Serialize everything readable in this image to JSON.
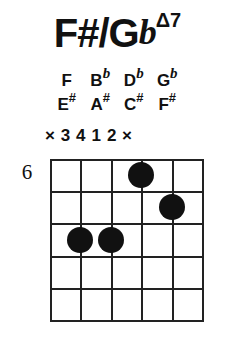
{
  "chord": {
    "root_primary": "F#",
    "slash": "/",
    "root_secondary": "G",
    "root_secondary_flat": "b",
    "quality": "Δ7",
    "full_name": "F#/GbΔ7"
  },
  "notes_flat": [
    {
      "letter": "F",
      "accidental": ""
    },
    {
      "letter": "B",
      "accidental": "b"
    },
    {
      "letter": "D",
      "accidental": "b"
    },
    {
      "letter": "G",
      "accidental": "b"
    }
  ],
  "notes_sharp": [
    {
      "letter": "E",
      "accidental": "#"
    },
    {
      "letter": "A",
      "accidental": "#"
    },
    {
      "letter": "C",
      "accidental": "#"
    },
    {
      "letter": "F",
      "accidental": "#"
    }
  ],
  "fingering": [
    "×",
    "3",
    "4",
    "1",
    "2",
    "×"
  ],
  "fret_position_label": "6",
  "diagram": {
    "string_count": 6,
    "fret_count": 5,
    "dots": [
      {
        "string": 4,
        "fret": 1,
        "finger": "1"
      },
      {
        "string": 5,
        "fret": 2,
        "finger": "2"
      },
      {
        "string": 2,
        "fret": 3,
        "finger": "3"
      },
      {
        "string": 3,
        "fret": 3,
        "finger": "4"
      }
    ]
  },
  "colors": {
    "ink": "#111111",
    "line": "#222222",
    "background": "#ffffff"
  }
}
